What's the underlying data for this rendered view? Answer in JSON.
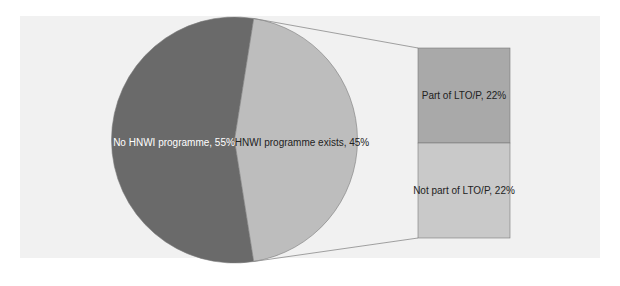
{
  "chart_data": {
    "type": "pie-of-bar",
    "title": "",
    "pie": {
      "categories": [
        "No HNWI programme",
        "HNWI programme exists"
      ],
      "values": [
        55,
        45
      ],
      "labels": [
        "No HNWI programme, 55%",
        "HNWI programme exists, 45%"
      ],
      "colors": [
        "#6a6a6a",
        "#bdbdbd"
      ]
    },
    "bar": {
      "parent": "HNWI programme exists",
      "categories": [
        "Part of LTO/P",
        "Not part of LTO/P"
      ],
      "values": [
        22,
        22
      ],
      "labels": [
        "Part of LTO/P, 22%",
        "Not part of LTO/P, 22%"
      ],
      "colors": [
        "#a9a9a9",
        "#c9c9c9"
      ]
    },
    "legend": "none",
    "grid": false
  },
  "colors": {
    "background": "#f1f1f1",
    "connector": "#8a8a8a",
    "outline": "#7a7a7a"
  }
}
